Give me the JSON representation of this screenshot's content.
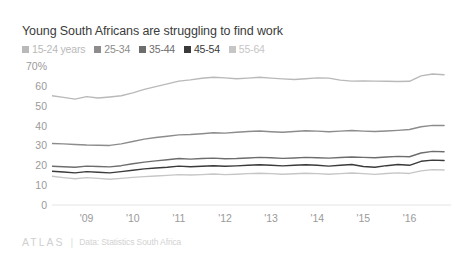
{
  "chart_data": {
    "type": "line",
    "title": "Young South Africans are struggling to find work",
    "xlabel": "",
    "ylabel": "",
    "ylim": [
      0,
      70
    ],
    "yticks": [
      70,
      60,
      50,
      40,
      30,
      20,
      10,
      0
    ],
    "ytick_labels": [
      "70%",
      "60",
      "50",
      "40",
      "30",
      "20",
      "10",
      "0"
    ],
    "xtick_labels": [
      "'09",
      "'10",
      "'11",
      "'12",
      "'13",
      "'14",
      "'15",
      "'16"
    ],
    "x": [
      2008.25,
      2008.5,
      2008.75,
      2009.0,
      2009.25,
      2009.5,
      2009.75,
      2010.0,
      2010.25,
      2010.5,
      2010.75,
      2011.0,
      2011.25,
      2011.5,
      2011.75,
      2012.0,
      2012.25,
      2012.5,
      2012.75,
      2013.0,
      2013.25,
      2013.5,
      2013.75,
      2014.0,
      2014.25,
      2014.5,
      2014.75,
      2015.0,
      2015.25,
      2015.5,
      2015.75,
      2016.0,
      2016.25,
      2016.5,
      2016.75
    ],
    "xlim": [
      2008.25,
      2016.9
    ],
    "grid": false,
    "legend_position": "top",
    "series": [
      {
        "name": "15-24 years",
        "color": "#b9b9b9",
        "values": [
          55.0,
          54.2,
          53.3,
          54.6,
          53.9,
          54.4,
          55.0,
          56.5,
          58.2,
          59.6,
          61.0,
          62.4,
          63.0,
          63.8,
          64.3,
          64.0,
          63.6,
          63.9,
          64.3,
          63.9,
          63.5,
          63.2,
          63.6,
          64.0,
          63.9,
          62.9,
          62.4,
          62.5,
          62.4,
          62.3,
          62.2,
          62.3,
          65.0,
          66.0,
          65.6
        ]
      },
      {
        "name": "25-34",
        "color": "#8c8c8c",
        "values": [
          31.0,
          30.8,
          30.5,
          30.2,
          30.1,
          30.0,
          30.8,
          32.0,
          33.2,
          34.0,
          34.6,
          35.3,
          35.5,
          35.9,
          36.4,
          36.2,
          36.6,
          37.0,
          37.3,
          36.9,
          36.6,
          37.0,
          37.4,
          37.2,
          36.9,
          37.2,
          37.5,
          37.2,
          37.0,
          37.3,
          37.6,
          38.0,
          39.4,
          40.1,
          40.0
        ]
      },
      {
        "name": "35-44",
        "color": "#6d6d6d",
        "values": [
          19.5,
          19.3,
          19.0,
          19.6,
          19.4,
          19.2,
          19.8,
          20.8,
          21.6,
          22.2,
          22.8,
          23.4,
          23.1,
          23.4,
          23.6,
          23.3,
          23.4,
          23.7,
          24.0,
          23.8,
          23.5,
          23.7,
          24.0,
          23.8,
          23.6,
          23.9,
          24.2,
          24.0,
          23.8,
          24.2,
          24.5,
          24.3,
          26.2,
          27.0,
          26.8
        ]
      },
      {
        "name": "45-54",
        "color": "#3a3a3a",
        "values": [
          17.0,
          16.6,
          16.2,
          16.8,
          16.5,
          16.2,
          16.8,
          17.5,
          18.2,
          18.6,
          19.0,
          19.6,
          19.3,
          19.5,
          19.8,
          19.5,
          19.7,
          20.0,
          20.3,
          20.0,
          19.7,
          20.0,
          20.3,
          20.0,
          19.6,
          20.0,
          20.4,
          19.4,
          19.0,
          19.8,
          20.4,
          20.0,
          22.0,
          22.6,
          22.4
        ]
      },
      {
        "name": "55-64",
        "color": "#c6c6c6",
        "values": [
          14.5,
          13.8,
          13.2,
          13.8,
          13.4,
          13.0,
          13.4,
          13.9,
          14.3,
          14.6,
          14.9,
          15.3,
          15.1,
          15.3,
          15.6,
          15.3,
          15.5,
          15.8,
          16.0,
          15.8,
          15.5,
          15.7,
          16.0,
          15.8,
          15.5,
          15.8,
          16.1,
          15.8,
          15.4,
          15.9,
          16.2,
          15.9,
          17.2,
          17.8,
          17.6
        ]
      }
    ]
  },
  "footer": {
    "logo": "ATLAS",
    "divider": "|",
    "source": "Data: Statistics South Africa"
  }
}
